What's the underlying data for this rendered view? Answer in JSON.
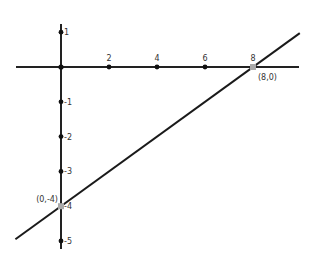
{
  "graph": {
    "line_color": "#1a1a1a",
    "axis_color": "#222222",
    "highlight_color": "#a9a9a9",
    "origin_px": {
      "x": 61,
      "y": 67
    },
    "x_unit_px": 24,
    "y_unit_px": 34.8,
    "x_ticks": [
      {
        "value": 2,
        "label": "2"
      },
      {
        "value": 4,
        "label": "4"
      },
      {
        "value": 6,
        "label": "6"
      },
      {
        "value": 8,
        "label": "8"
      }
    ],
    "y_ticks": [
      {
        "value": 1,
        "label": "1"
      },
      {
        "value": -1,
        "label": "-1"
      },
      {
        "value": -2,
        "label": "-2"
      },
      {
        "value": -3,
        "label": "-3"
      },
      {
        "value": -4,
        "label": "-4"
      },
      {
        "value": -5,
        "label": "-5"
      }
    ],
    "points": [
      {
        "x": 8,
        "y": 0,
        "label": "(8,0)"
      },
      {
        "x": 0,
        "y": -4,
        "label": "(0,-4)"
      }
    ],
    "line": {
      "slope": 0.5,
      "intercept": -4,
      "equation": "y = x/2 - 4"
    }
  }
}
